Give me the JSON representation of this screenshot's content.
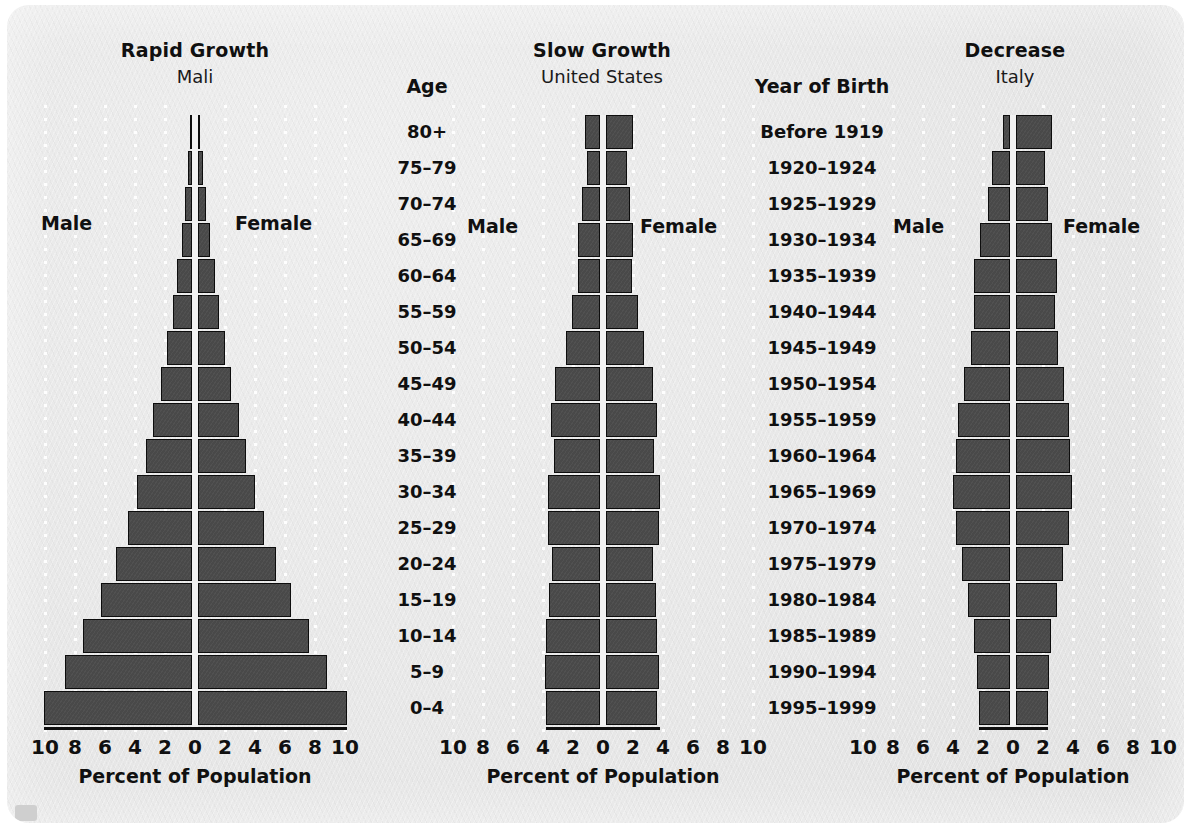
{
  "figure": {
    "background_color": "#e7e7e7",
    "bar_color": "#494949",
    "bar_edge_color": "#0d0d0d",
    "axis_title": "Percent of Population",
    "tick_labels": [
      "10",
      "8",
      "6",
      "4",
      "2",
      "0",
      "2",
      "4",
      "6",
      "8",
      "10"
    ],
    "male_label": "Male",
    "female_label": "Female"
  },
  "age_column": {
    "header": "Age",
    "items": [
      "80+",
      "75–79",
      "70–74",
      "65–69",
      "60–64",
      "55–59",
      "50–54",
      "45–49",
      "40–44",
      "35–39",
      "30–34",
      "25–29",
      "20–24",
      "15–19",
      "10–14",
      "5–9",
      "0–4"
    ]
  },
  "year_column": {
    "header": "Year of Birth",
    "items": [
      "Before 1919",
      "1920–1924",
      "1925–1929",
      "1930–1934",
      "1935–1939",
      "1940–1944",
      "1945–1949",
      "1950–1954",
      "1955–1959",
      "1960–1964",
      "1965–1969",
      "1970–1974",
      "1975–1979",
      "1980–1984",
      "1985–1989",
      "1990–1994",
      "1995–1999"
    ]
  },
  "chart_data": [
    {
      "type": "bar",
      "title": "Rapid Growth",
      "subtitle": "Mali",
      "xlabel": "Percent of Population",
      "ylabel": "Age",
      "xlim": [
        -10,
        10
      ],
      "grid": true,
      "legend_position": "inside",
      "categories": [
        "80+",
        "75–79",
        "70–74",
        "65–69",
        "60–64",
        "55–59",
        "50–54",
        "45–49",
        "40–44",
        "35–39",
        "30–34",
        "25–29",
        "20–24",
        "15–19",
        "10–14",
        "5–9",
        "0–4"
      ],
      "series": [
        {
          "name": "Male",
          "values": [
            0.15,
            0.25,
            0.45,
            0.7,
            1.0,
            1.3,
            1.7,
            2.1,
            2.6,
            3.1,
            3.7,
            4.3,
            5.1,
            6.1,
            7.3,
            8.5,
            9.9
          ]
        },
        {
          "name": "Female",
          "values": [
            0.15,
            0.3,
            0.5,
            0.8,
            1.1,
            1.4,
            1.8,
            2.2,
            2.7,
            3.2,
            3.8,
            4.4,
            5.2,
            6.2,
            7.4,
            8.6,
            9.9
          ]
        }
      ]
    },
    {
      "type": "bar",
      "title": "Slow Growth",
      "subtitle": "United States",
      "xlabel": "Percent of Population",
      "ylabel": "Year of Birth",
      "xlim": [
        -10,
        10
      ],
      "grid": true,
      "legend_position": "inside",
      "categories": [
        "Before 1919",
        "1920–1924",
        "1925–1929",
        "1930–1934",
        "1935–1939",
        "1940–1944",
        "1945–1949",
        "1950–1954",
        "1955–1959",
        "1960–1964",
        "1965–1969",
        "1970–1974",
        "1975–1979",
        "1980–1984",
        "1985–1989",
        "1990–1994",
        "1995–1999"
      ],
      "series": [
        {
          "name": "Male",
          "values": [
            1.0,
            0.9,
            1.2,
            1.5,
            1.5,
            1.9,
            2.3,
            3.0,
            3.3,
            3.1,
            3.5,
            3.5,
            3.2,
            3.4,
            3.6,
            3.7,
            3.6
          ]
        },
        {
          "name": "Female",
          "values": [
            1.8,
            1.4,
            1.6,
            1.8,
            1.7,
            2.1,
            2.5,
            3.1,
            3.4,
            3.2,
            3.6,
            3.5,
            3.1,
            3.3,
            3.4,
            3.5,
            3.4
          ]
        }
      ]
    },
    {
      "type": "bar",
      "title": "Decrease",
      "subtitle": "Italy",
      "xlabel": "Percent of Population",
      "ylabel": "Year of Birth",
      "xlim": [
        -10,
        10
      ],
      "grid": true,
      "legend_position": "inside",
      "categories": [
        "Before 1919",
        "1920–1924",
        "1925–1929",
        "1930–1934",
        "1935–1939",
        "1940–1944",
        "1945–1949",
        "1950–1954",
        "1955–1959",
        "1960–1964",
        "1965–1969",
        "1970–1974",
        "1975–1979",
        "1980–1984",
        "1985–1989",
        "1990–1994",
        "1995–1999"
      ],
      "series": [
        {
          "name": "Male",
          "values": [
            0.5,
            1.2,
            1.5,
            2.0,
            2.4,
            2.4,
            2.6,
            3.1,
            3.5,
            3.6,
            3.8,
            3.6,
            3.2,
            2.8,
            2.4,
            2.2,
            2.1
          ]
        },
        {
          "name": "Female",
          "values": [
            2.4,
            1.9,
            2.1,
            2.4,
            2.7,
            2.6,
            2.8,
            3.2,
            3.5,
            3.6,
            3.7,
            3.5,
            3.1,
            2.7,
            2.3,
            2.2,
            2.1
          ]
        }
      ]
    }
  ]
}
